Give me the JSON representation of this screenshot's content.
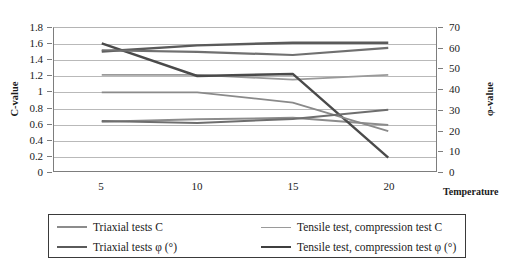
{
  "chart_data": {
    "type": "line",
    "title": "",
    "xlabel": "Temperature",
    "ylabel": "C-value",
    "y2label": "φ-value",
    "x": [
      5,
      10,
      15,
      20
    ],
    "xticklabels": [
      "5",
      "10",
      "15",
      "20"
    ],
    "xlim": [
      2.5,
      22.5
    ],
    "ylim": [
      0,
      1.8
    ],
    "yticks": [
      0,
      0.2,
      0.4,
      0.6,
      0.8,
      1,
      1.2,
      1.4,
      1.6,
      1.8
    ],
    "yticklabels": [
      "0",
      "0.2",
      "0.4",
      "0.6",
      "0.8",
      "1",
      "1.2",
      "1.4",
      "1.6",
      "1.8"
    ],
    "y2lim": [
      0,
      70
    ],
    "y2ticks": [
      0,
      10,
      20,
      30,
      40,
      50,
      60,
      70
    ],
    "y2ticklabels": [
      "0",
      "10",
      "20",
      "30",
      "40",
      "50",
      "60",
      "70"
    ],
    "grid": true,
    "legend_position": "below",
    "series": [
      {
        "name": "Triaxial tests C",
        "axis": "left",
        "color": "#8c8c8c",
        "width": 2.0,
        "values": [
          0.62,
          0.65,
          0.67,
          0.58
        ]
      },
      {
        "name": "Triaxial tests φ (°)",
        "axis": "right",
        "color": "#5a5a5a",
        "width": 2.4,
        "values": [
          58.5,
          61.5,
          62.8,
          62.8
        ]
      },
      {
        "name": "Tensile test, compression test C",
        "axis": "left",
        "color": "#9a9a9a",
        "width": 1.8,
        "values": [
          1.21,
          1.21,
          1.15,
          1.21
        ]
      },
      {
        "name": "Tensile test, compression test φ (°)",
        "axis": "right",
        "color": "#4a4a4a",
        "width": 2.4,
        "values": [
          62.5,
          46.5,
          47.5,
          6.5
        ]
      },
      {
        "name": "series-upper-c",
        "axis": "left",
        "color": "#707070",
        "width": 2.2,
        "values": [
          1.52,
          1.5,
          1.46,
          1.55
        ]
      },
      {
        "name": "series-mid-phi",
        "axis": "right",
        "color": "#8a8a8a",
        "width": 1.8,
        "values": [
          38.5,
          38.5,
          33.5,
          19.5
        ]
      },
      {
        "name": "series-low-phi",
        "axis": "right",
        "color": "#6e6e6e",
        "width": 2.0,
        "values": [
          24.5,
          23.5,
          25.5,
          30.0
        ]
      }
    ],
    "legend_entries": [
      {
        "label": "Triaxial tests C",
        "color": "#8c8c8c",
        "width": 2.0
      },
      {
        "label": "Triaxial tests φ (°)",
        "color": "#5a5a5a",
        "width": 2.8
      },
      {
        "label": "Tensile test, compression test C",
        "color": "#9a9a9a",
        "width": 1.6
      },
      {
        "label": "Tensile test, compression test φ (°)",
        "color": "#3f3f3f",
        "width": 2.8
      }
    ]
  },
  "axes": {
    "left_title": "C-value",
    "right_title": "φ-value",
    "x_title": "Temperature"
  },
  "colors": {
    "grid": "#b9b9b9",
    "axis": "#7d7d7d",
    "legend_border": "#3a3a3a",
    "text": "#1a1a1a",
    "background": "#ffffff"
  }
}
